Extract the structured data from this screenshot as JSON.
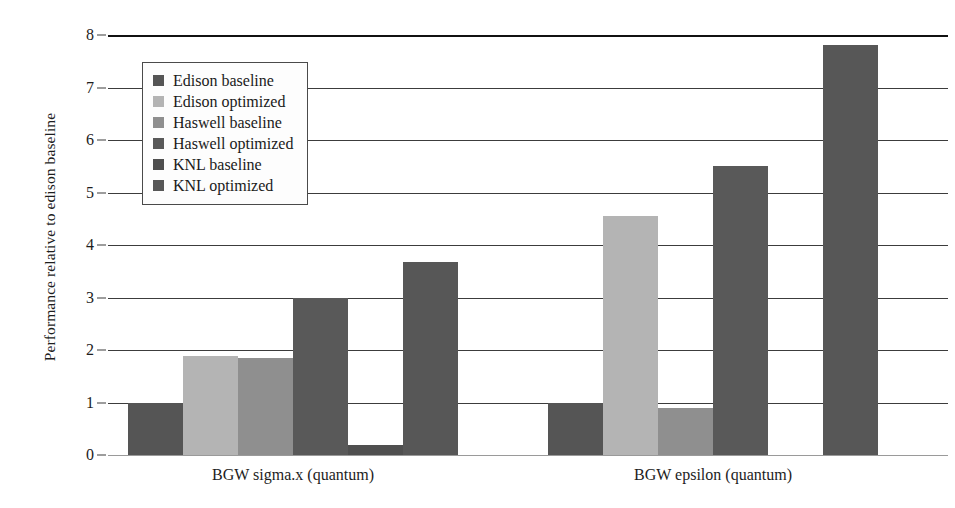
{
  "chart_data": {
    "type": "bar",
    "title": "",
    "subtitle": "",
    "xlabel": "",
    "ylabel": "Performance relative to edison baseline",
    "ylim": [
      0,
      8
    ],
    "yticks": [
      0,
      1,
      2,
      3,
      4,
      5,
      6,
      7,
      8
    ],
    "ytick_labels": [
      "0",
      "1",
      "2",
      "3",
      "4",
      "5",
      "6",
      "7",
      "8"
    ],
    "grid": "horizontal",
    "legend_position": "upper-left-inside",
    "categories": [
      "BGW sigma.x (quantum)",
      "BGW epsilon (quantum)"
    ],
    "series": [
      {
        "name": "Edison baseline",
        "color": "#555555",
        "values": [
          1.0,
          1.0
        ]
      },
      {
        "name": "Edison optimized",
        "color": "#b4b4b4",
        "values": [
          1.88,
          4.55
        ]
      },
      {
        "name": "Haswell baseline",
        "color": "#8f8f8f",
        "values": [
          1.85,
          0.9
        ]
      },
      {
        "name": "Haswell optimized",
        "color": "#595959",
        "values": [
          3.0,
          5.5
        ]
      },
      {
        "name": "KNL baseline",
        "color": "#4f4f4f",
        "values": [
          0.2,
          0.0
        ]
      },
      {
        "name": "KNL optimized",
        "color": "#575757",
        "values": [
          3.67,
          7.81
        ]
      }
    ]
  },
  "legend": {
    "items": [
      {
        "label": "Edison baseline",
        "swatch_color": "#555555"
      },
      {
        "label": "Edison optimized",
        "swatch_color": "#b4b4b4"
      },
      {
        "label": "Haswell baseline",
        "swatch_color": "#8f8f8f"
      },
      {
        "label": "Haswell optimized",
        "swatch_color": "#595959"
      },
      {
        "label": "KNL baseline",
        "swatch_color": "#4f4f4f"
      },
      {
        "label": "KNL optimized",
        "swatch_color": "#575757"
      }
    ]
  },
  "axes": {
    "y_title": "Performance relative to edison baseline",
    "y_tick_labels": [
      "8",
      "7",
      "6",
      "5",
      "4",
      "3",
      "2",
      "1",
      "0"
    ],
    "x_group_labels": [
      "BGW sigma.x (quantum)",
      "BGW epsilon (quantum)"
    ]
  }
}
